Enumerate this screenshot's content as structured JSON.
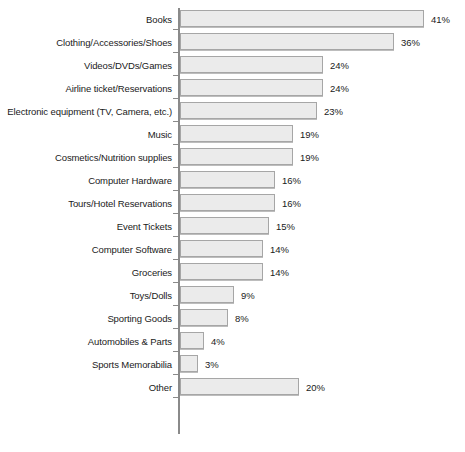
{
  "chart_data": {
    "type": "bar",
    "orientation": "horizontal",
    "title": "",
    "subtitle": "",
    "xlabel": "",
    "ylabel": "",
    "xlim": [
      0,
      41
    ],
    "grid": false,
    "legend": null,
    "value_suffix": "%",
    "categories": [
      "Books",
      "Clothing/Accessories/Shoes",
      "Videos/DVDs/Games",
      "Airline ticket/Reservations",
      "Electronic equipment (TV, Camera, etc.)",
      "Music",
      "Cosmetics/Nutrition supplies",
      "Computer Hardware",
      "Tours/Hotel Reservations",
      "Event Tickets",
      "Computer Software",
      "Groceries",
      "Toys/Dolls",
      "Sporting Goods",
      "Automobiles & Parts",
      "Sports Memorabilia",
      "Other"
    ],
    "values": [
      41,
      36,
      24,
      24,
      23,
      19,
      19,
      16,
      16,
      15,
      14,
      14,
      9,
      8,
      4,
      3,
      20
    ],
    "data_labels": [
      "41%",
      "36%",
      "24%",
      "24%",
      "23%",
      "19%",
      "19%",
      "16%",
      "16%",
      "15%",
      "14%",
      "14%",
      "9%",
      "8%",
      "4%",
      "3%",
      "20%"
    ],
    "colors": {
      "bar_fill": "#ebebeb",
      "bar_border": "#a6a6a6",
      "axis": "#8a8a8a",
      "text": "#1a1a1a",
      "background": "#ffffff"
    },
    "scale_px_per_unit": 5.95
  }
}
